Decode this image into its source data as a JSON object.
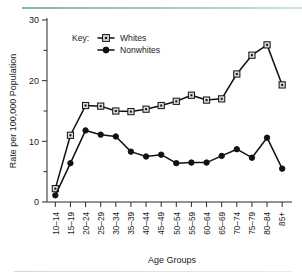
{
  "figure": {
    "background_color": "#ffffff",
    "rule_color": "#7fb3b3"
  },
  "legend": {
    "key_label": "Key:",
    "entries": [
      {
        "name": "Whites",
        "marker": "open-square-dot-marker",
        "color": "#d9d9d9"
      },
      {
        "name": "Nonwhites",
        "marker": "filled-circle-marker",
        "color": "#111111"
      }
    ]
  },
  "axes": {
    "x_title": "Age Groups",
    "y_title": "Rate per 100,000 Population",
    "y_major_labels": [
      "0",
      "10",
      "20",
      "30"
    ],
    "y_major_values": [
      0,
      10,
      20,
      30
    ],
    "y_minor_values": [
      5,
      15,
      25
    ]
  },
  "chart_data": {
    "type": "line",
    "title": "",
    "xlabel": "Age Groups",
    "ylabel": "Rate per 100,000 Population",
    "ylim": [
      0,
      30
    ],
    "grid": false,
    "legend_position": "top-center",
    "categories": [
      "10–14",
      "15–19",
      "20–24",
      "25–29",
      "30–34",
      "35–39",
      "40–44",
      "45–49",
      "50–54",
      "55–59",
      "60–64",
      "65–69",
      "70–74",
      "75–79",
      "80–84",
      "85+"
    ],
    "series": [
      {
        "name": "Whites",
        "marker": "open-square",
        "values": [
          2.2,
          11.0,
          15.9,
          15.8,
          15.0,
          14.9,
          15.3,
          15.9,
          16.6,
          17.6,
          16.8,
          17.0,
          21.1,
          24.2,
          25.9,
          19.3
        ]
      },
      {
        "name": "Nonwhites",
        "marker": "filled-circle",
        "values": [
          1.1,
          6.4,
          11.8,
          11.1,
          10.8,
          8.3,
          7.5,
          7.8,
          6.4,
          6.5,
          6.5,
          7.6,
          8.7,
          7.3,
          10.6,
          5.5
        ]
      }
    ]
  }
}
